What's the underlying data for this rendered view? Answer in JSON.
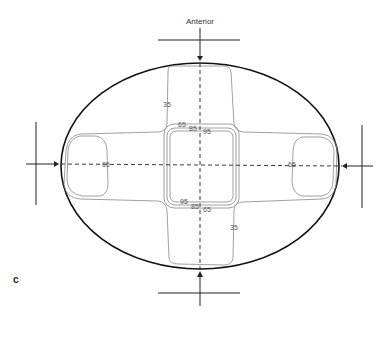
{
  "figure": {
    "panel_label": "c",
    "direction_label": "Anterior",
    "contours": {
      "outer": "35",
      "middle": "65",
      "inner_a": "85",
      "inner_b": "95"
    },
    "labels": {
      "top_35": "35",
      "top_65": "65",
      "top_85": "85",
      "top_95": "95",
      "bottom_95": "95",
      "bottom_85": "85",
      "bottom_65": "65",
      "bottom_35": "35",
      "left_65": "65",
      "right_65": "65"
    },
    "colors": {
      "outline": "#111111",
      "contour": "#777777",
      "axis": "#222222"
    }
  }
}
